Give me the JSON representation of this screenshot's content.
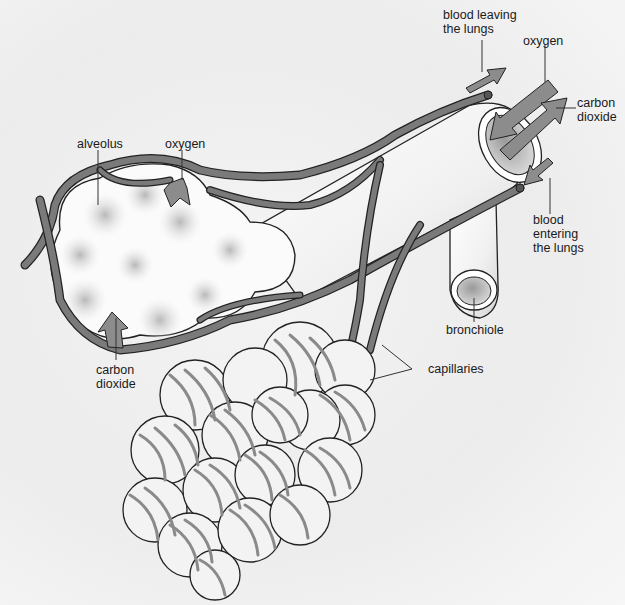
{
  "diagram": {
    "colors": {
      "background": "#efefef",
      "vessel": "#7a7a7a",
      "outline": "#222222",
      "arrow": "#8a8a8a",
      "alveolus": "#fafafa",
      "shading": "#c8c8c8"
    },
    "labels": {
      "blood_leaving": [
        "blood leaving",
        "the lungs"
      ],
      "oxygen_top": "oxygen",
      "carbon_dioxide_top": [
        "carbon",
        "dioxide"
      ],
      "alveolus": "alveolus",
      "oxygen_alveolus": "oxygen",
      "blood_entering": [
        "blood",
        "entering",
        "the lungs"
      ],
      "bronchiole": "bronchiole",
      "carbon_dioxide_bottom": [
        "carbon",
        "dioxide"
      ],
      "capillaries": "capillaries"
    },
    "icons": {
      "gas_arrow": "block-arrow",
      "blood_flow_arrow": "block-arrow"
    }
  }
}
